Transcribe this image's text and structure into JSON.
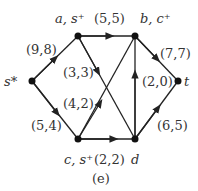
{
  "caption": "(e)",
  "nodes": {
    "s": {
      "label": "s*",
      "x": 32,
      "y": 81
    },
    "a": {
      "label": "a, s⁺",
      "x": 78,
      "y": 36
    },
    "b": {
      "label": "b, c⁺",
      "x": 135,
      "y": 36
    },
    "t": {
      "label": "t",
      "x": 178,
      "y": 81
    },
    "c": {
      "label": "c, s⁺",
      "x": 78,
      "y": 139
    },
    "d": {
      "label": "d",
      "x": 135,
      "y": 139
    }
  },
  "edges": [
    {
      "from": "s",
      "to": "a",
      "label": "(9,8)"
    },
    {
      "from": "a",
      "to": "b",
      "label": "(5,5)"
    },
    {
      "from": "b",
      "to": "t",
      "label": "(7,7)"
    },
    {
      "from": "s",
      "to": "c",
      "label": "(5,4)"
    },
    {
      "from": "c",
      "to": "d",
      "label": "(2,2)"
    },
    {
      "from": "d",
      "to": "t",
      "label": "(6,5)"
    },
    {
      "from": "a",
      "to": "d",
      "label": "(3,3)"
    },
    {
      "from": "c",
      "to": "b",
      "label": "(4,2)"
    },
    {
      "from": "d",
      "to": "b",
      "label": "(2,0)"
    }
  ]
}
